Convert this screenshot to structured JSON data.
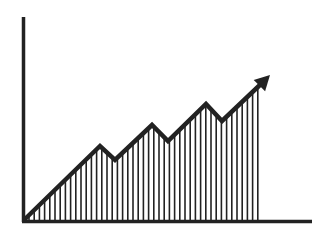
{
  "colors": {
    "background": "#ffffff",
    "stroke": "#222222"
  },
  "chart_data": {
    "type": "area",
    "title": "",
    "xlabel": "",
    "ylabel": "",
    "grid": false,
    "legend": null,
    "fill": "vertical-hatch",
    "arrowhead": true,
    "points": [
      {
        "x": 0,
        "y": 0
      },
      {
        "x": 1,
        "y": 36
      },
      {
        "x": 2,
        "y": 29
      },
      {
        "x": 3,
        "y": 46
      },
      {
        "x": 4,
        "y": 38
      },
      {
        "x": 5,
        "y": 57
      },
      {
        "x": 6,
        "y": 49
      },
      {
        "x": 7,
        "y": 70
      }
    ],
    "ylim": [
      0,
      100
    ]
  },
  "geometry": {
    "y_axis": {
      "x": 23.5,
      "y1": 17,
      "y2": 222
    },
    "x_axis": {
      "y": 221.5,
      "x1": 22,
      "x2": 312
    },
    "line_px": [
      [
        24,
        220
      ],
      [
        100,
        146
      ],
      [
        115,
        160
      ],
      [
        152,
        125
      ],
      [
        168,
        141
      ],
      [
        206,
        104
      ],
      [
        222,
        121
      ],
      [
        262,
        83
      ]
    ],
    "arrow_tip": [
      270,
      75
    ],
    "hatch": {
      "x_start": 29,
      "x_end": 262,
      "step": 5.2,
      "baseline": 220
    }
  }
}
